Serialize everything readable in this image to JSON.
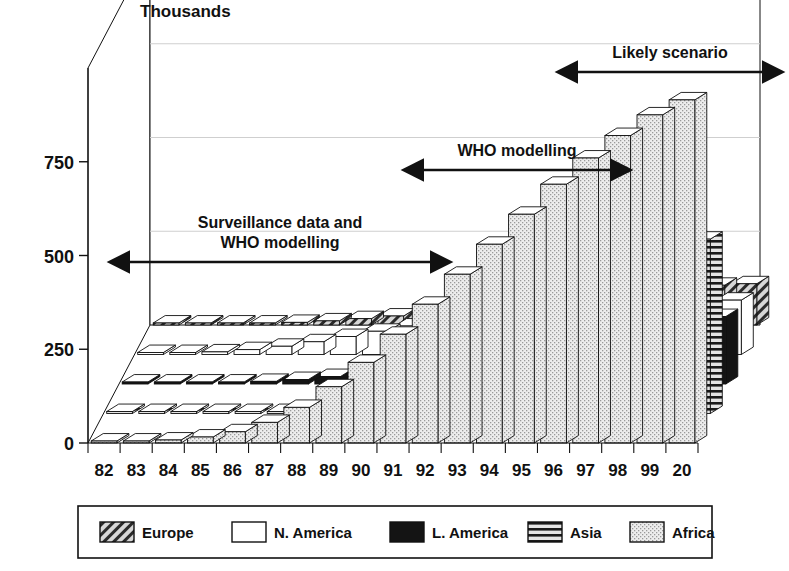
{
  "figure": {
    "axis_title": "Thousands",
    "y_ticks": [
      "0",
      "250",
      "500",
      "750"
    ],
    "x_ticks": [
      "82",
      "83",
      "84",
      "85",
      "86",
      "87",
      "88",
      "89",
      "90",
      "91",
      "92",
      "93",
      "94",
      "95",
      "96",
      "97",
      "98",
      "99",
      "20"
    ]
  },
  "annotations": [
    {
      "id": "surveillance",
      "line1": "Surveillance data and",
      "line2": "WHO modelling"
    },
    {
      "id": "who",
      "line1": "WHO modelling",
      "line2": ""
    },
    {
      "id": "likely",
      "line1": "Likely scenario",
      "line2": ""
    }
  ],
  "legend": {
    "items": [
      {
        "label": "Europe",
        "pattern": "diagonal-hatch"
      },
      {
        "label": "N. America",
        "pattern": "white"
      },
      {
        "label": "L. America",
        "pattern": "solid-black"
      },
      {
        "label": "Asia",
        "pattern": "horizontal-lines"
      },
      {
        "label": "Africa",
        "pattern": "light-stipple"
      }
    ]
  },
  "colors": {
    "ink": "#111111",
    "africa_fill": "#e6e6e6",
    "asia_fill": "#d9d9d9",
    "lamerica_fill": "#141414",
    "namerica_fill": "#ffffff",
    "europe_fill": "#c9c9c9"
  },
  "chart_data": {
    "type": "bar",
    "title": "",
    "subtitle": "",
    "xlabel": "",
    "ylabel": "Thousands",
    "ylim": [
      0,
      1000
    ],
    "yticks": [
      0,
      250,
      500,
      750
    ],
    "grid": true,
    "legend_position": "bottom",
    "projection": "3d-stacked-rows",
    "categories": [
      "82",
      "83",
      "84",
      "85",
      "86",
      "87",
      "88",
      "89",
      "90",
      "91",
      "92",
      "93",
      "94",
      "95",
      "96",
      "97",
      "98",
      "99",
      "20"
    ],
    "series": [
      {
        "name": "Africa",
        "depth_row": 0,
        "values": [
          2,
          4,
          8,
          16,
          30,
          55,
          95,
          150,
          215,
          290,
          370,
          450,
          530,
          610,
          690,
          760,
          820,
          875,
          915
        ]
      },
      {
        "name": "Asia",
        "depth_row": 1,
        "values": [
          0,
          0,
          0,
          1,
          2,
          3,
          5,
          8,
          13,
          22,
          38,
          62,
          95,
          140,
          195,
          255,
          320,
          390,
          465
        ]
      },
      {
        "name": "L. America",
        "depth_row": 2,
        "values": [
          0,
          1,
          2,
          4,
          7,
          12,
          20,
          30,
          44,
          60,
          78,
          96,
          112,
          128,
          142,
          154,
          164,
          172,
          180
        ]
      },
      {
        "name": "N. America",
        "depth_row": 3,
        "values": [
          1,
          3,
          7,
          13,
          22,
          34,
          48,
          62,
          76,
          88,
          99,
          108,
          116,
          123,
          129,
          134,
          138,
          142,
          145
        ]
      },
      {
        "name": "Europe",
        "depth_row": 4,
        "values": [
          0,
          1,
          2,
          4,
          7,
          11,
          17,
          24,
          33,
          43,
          53,
          63,
          72,
          80,
          88,
          95,
          101,
          106,
          110
        ]
      }
    ]
  }
}
